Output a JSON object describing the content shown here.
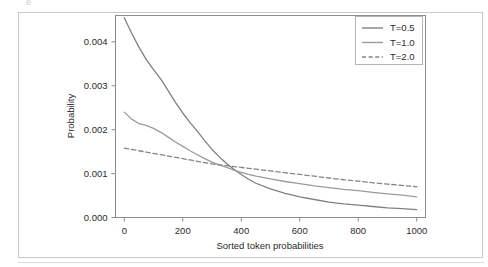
{
  "figure": {
    "artifact_glyph": "e",
    "frame_color": "#c9c9c9"
  },
  "chart_data": {
    "type": "line",
    "title": "",
    "xlabel": "Sorted token probabilities",
    "ylabel": "Probability",
    "xlim": [
      -30,
      1030
    ],
    "ylim": [
      0.0,
      0.0046
    ],
    "xticks": [
      0,
      200,
      400,
      600,
      800,
      1000
    ],
    "xticklabels": [
      "0",
      "200",
      "400",
      "600",
      "800",
      "1000"
    ],
    "yticks": [
      0.0,
      0.001,
      0.002,
      0.003,
      0.004
    ],
    "yticklabels": [
      "0.000",
      "0.001",
      "0.002",
      "0.003",
      "0.004"
    ],
    "grid": false,
    "legend_position": "upper right",
    "x": [
      0,
      25,
      50,
      75,
      100,
      125,
      150,
      175,
      200,
      225,
      250,
      275,
      300,
      325,
      350,
      375,
      400,
      425,
      450,
      500,
      550,
      600,
      650,
      700,
      750,
      800,
      850,
      900,
      950,
      1000
    ],
    "series": [
      {
        "name": "T=0.5",
        "label": "T=0.5",
        "color": "#808080",
        "linestyle": "solid",
        "values": [
          0.00455,
          0.0042,
          0.00388,
          0.0036,
          0.00337,
          0.00315,
          0.00289,
          0.00262,
          0.00238,
          0.00216,
          0.00196,
          0.00175,
          0.00155,
          0.00138,
          0.00123,
          0.0011,
          0.00098,
          0.00087,
          0.00078,
          0.00065,
          0.00055,
          0.00047,
          0.00041,
          0.00035,
          0.00031,
          0.00028,
          0.00025,
          0.00022,
          0.0002,
          0.00018
        ]
      },
      {
        "name": "T=1.0",
        "label": "T=1.0",
        "color": "#9b9b9b",
        "linestyle": "solid",
        "values": [
          0.0024,
          0.00224,
          0.00214,
          0.0021,
          0.00203,
          0.00194,
          0.00183,
          0.00172,
          0.00162,
          0.00152,
          0.00143,
          0.00134,
          0.00126,
          0.0012,
          0.00114,
          0.00108,
          0.00103,
          0.00098,
          0.00094,
          0.00088,
          0.00082,
          0.00077,
          0.00072,
          0.00068,
          0.00064,
          0.00061,
          0.00057,
          0.00054,
          0.00051,
          0.00047
        ]
      },
      {
        "name": "T=2.0",
        "label": "T=2.0",
        "color": "#858585",
        "linestyle": "dashed",
        "values": [
          0.00158,
          0.00155,
          0.00152,
          0.00149,
          0.00146,
          0.00143,
          0.0014,
          0.00137,
          0.00134,
          0.00131,
          0.00128,
          0.00125,
          0.00122,
          0.0012,
          0.00118,
          0.00116,
          0.00114,
          0.00112,
          0.0011,
          0.00106,
          0.00102,
          0.00098,
          0.00094,
          0.0009,
          0.00086,
          0.00083,
          0.00079,
          0.00076,
          0.00073,
          0.0007
        ]
      }
    ]
  }
}
